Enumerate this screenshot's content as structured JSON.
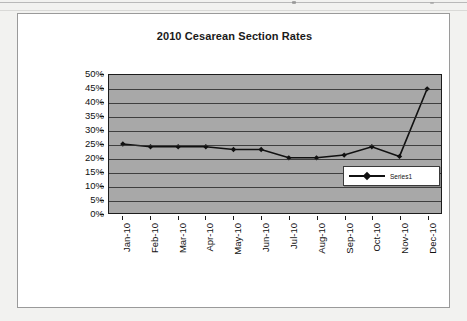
{
  "page": {
    "background_color": "#f2f2f0",
    "artifacts": [
      "scan-line-top",
      "scan-speck"
    ]
  },
  "chart_frame": {
    "border_color": "#9a9a9a",
    "background_color": "#ffffff"
  },
  "chart_data": {
    "type": "line",
    "title": "2010 Cesarean Section Rates",
    "xlabel": "",
    "ylabel": "",
    "categories": [
      "Jan-10",
      "Feb-10",
      "Mar-10",
      "Apr-10",
      "May-10",
      "Jun-10",
      "Jul-10",
      "Aug-10",
      "Sep-10",
      "Oct-10",
      "Nov-10",
      "Dec-10"
    ],
    "series": [
      {
        "name": "Series1",
        "values": [
          25,
          24,
          24,
          24,
          23,
          23,
          20,
          20,
          21,
          24,
          20.5,
          45
        ],
        "line_color": "#111111",
        "marker": "diamond"
      }
    ],
    "ylim": [
      0,
      50
    ],
    "ytick_values": [
      50,
      45,
      40,
      35,
      30,
      25,
      20,
      15,
      10,
      5,
      0
    ],
    "ytick_labels": [
      "50%",
      "45%",
      "40%",
      "35%",
      "30%",
      "25%",
      "20%",
      "15%",
      "10%",
      "5%",
      "0%"
    ],
    "grid": true,
    "grid_axis": "y",
    "plot_background_color": "#a8a8a8",
    "legend_position": "right-inside"
  },
  "legend": {
    "entries": [
      {
        "label": "Series1",
        "marker_icon": "line-diamond-marker-icon"
      }
    ]
  }
}
